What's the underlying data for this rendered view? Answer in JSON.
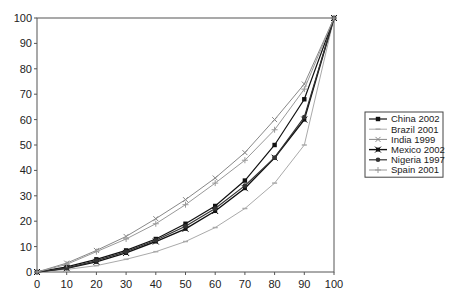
{
  "chart_data": {
    "type": "line",
    "title": "",
    "xlabel": "",
    "ylabel": "",
    "x": [
      0,
      10,
      20,
      30,
      40,
      50,
      60,
      70,
      80,
      90,
      100
    ],
    "xlim": [
      0,
      100
    ],
    "ylim": [
      0,
      100
    ],
    "x_ticks": [
      0,
      10,
      20,
      30,
      40,
      50,
      60,
      70,
      80,
      90,
      100
    ],
    "y_ticks": [
      0,
      10,
      20,
      30,
      40,
      50,
      60,
      70,
      80,
      90,
      100
    ],
    "grid": false,
    "legend_position": "right",
    "series": [
      {
        "name": "China 2002",
        "color": "#111111",
        "marker": "square",
        "width": 1.2,
        "values": [
          0,
          2,
          5,
          8.5,
          13,
          19,
          26,
          36,
          50,
          68,
          100
        ]
      },
      {
        "name": "Brazil 2001",
        "color": "#aaaaaa",
        "marker": "dash",
        "width": 1,
        "values": [
          0,
          1,
          2.5,
          5,
          8,
          12,
          17.5,
          25,
          35,
          50,
          100
        ]
      },
      {
        "name": "India 1999",
        "color": "#888888",
        "marker": "x",
        "width": 1,
        "values": [
          0,
          3.5,
          8.5,
          14,
          21,
          28.5,
          37,
          47,
          60,
          74,
          100
        ]
      },
      {
        "name": "Mexico 2002",
        "color": "#111111",
        "marker": "xsquare",
        "width": 1.4,
        "values": [
          0,
          1.5,
          4,
          7.5,
          12,
          17,
          24,
          33,
          45,
          60,
          100
        ]
      },
      {
        "name": "Nigeria 1997",
        "color": "#333333",
        "marker": "circle",
        "width": 1.2,
        "values": [
          0,
          1.5,
          4.5,
          8,
          12.5,
          18,
          25,
          34,
          45,
          61,
          100
        ]
      },
      {
        "name": "Spain 2001",
        "color": "#999999",
        "marker": "plus",
        "width": 1,
        "values": [
          0,
          3,
          8,
          13,
          19,
          26.5,
          35,
          44,
          56,
          72,
          100
        ]
      }
    ]
  }
}
